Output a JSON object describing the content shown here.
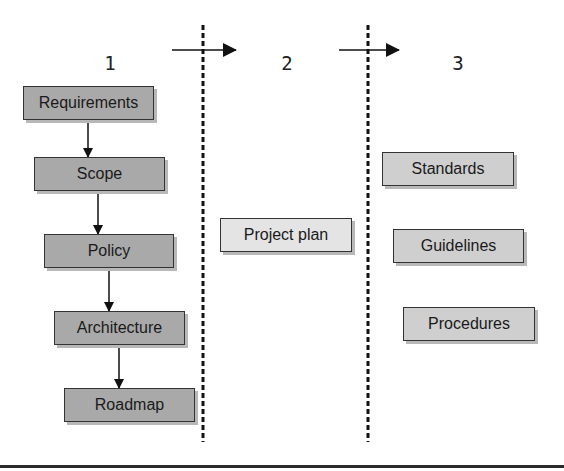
{
  "diagram": {
    "phases": [
      {
        "number": "1",
        "items": [
          "Requirements",
          "Scope",
          "Policy",
          "Architecture",
          "Roadmap"
        ]
      },
      {
        "number": "2",
        "items": [
          "Project plan"
        ]
      },
      {
        "number": "3",
        "items": [
          "Standards",
          "Guidelines",
          "Procedures"
        ]
      }
    ],
    "phase_labels": {
      "p1": "1",
      "p2": "2",
      "p3": "3"
    },
    "boxes": {
      "requirements": "Requirements",
      "scope": "Scope",
      "policy": "Policy",
      "architecture": "Architecture",
      "roadmap": "Roadmap",
      "project_plan": "Project plan",
      "standards": "Standards",
      "guidelines": "Guidelines",
      "procedures": "Procedures"
    },
    "flow": [
      [
        "Requirements",
        "Scope"
      ],
      [
        "Scope",
        "Policy"
      ],
      [
        "Policy",
        "Architecture"
      ],
      [
        "Architecture",
        "Roadmap"
      ],
      [
        "Phase 1",
        "Phase 2"
      ],
      [
        "Phase 2",
        "Phase 3"
      ]
    ],
    "colors": {
      "phase1_box": "#a9a9a9",
      "phase2_box": "#e4e4e4",
      "phase3_box": "#cfcfcf",
      "line": "#222222"
    }
  }
}
